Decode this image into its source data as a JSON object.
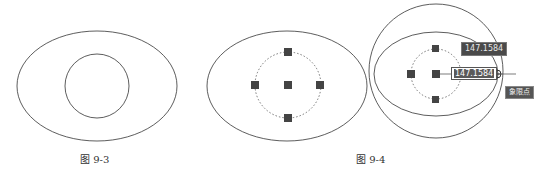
{
  "figures": [
    {
      "id": "fig-9-3",
      "caption": "图 9-3",
      "shapes": {
        "ellipse": {
          "cx": 97,
          "cy": 86,
          "rx": 80,
          "ry": 55
        },
        "inner_circle": {
          "cx": 97,
          "cy": 86,
          "r": 32
        }
      }
    },
    {
      "id": "fig-9-4",
      "caption": "图 9-4",
      "panel_a": {
        "ellipse": {
          "cx": 287,
          "cy": 86,
          "rx": 80,
          "ry": 55
        },
        "dashed_circle": {
          "cx": 288,
          "cy": 85,
          "r": 33
        },
        "grips": [
          "center",
          "top",
          "bottom",
          "left",
          "right"
        ]
      },
      "panel_b": {
        "outer_circle": {
          "cx": 436,
          "cy": 71,
          "r": 67
        },
        "ellipse": {
          "cx": 436,
          "cy": 74,
          "rx": 62,
          "ry": 42
        },
        "dashed_circle": {
          "cx": 436,
          "cy": 74,
          "r": 25
        },
        "grips": [
          "center",
          "top",
          "bottom",
          "left"
        ],
        "snap_marker": {
          "x": 497,
          "y": 74
        }
      }
    }
  ],
  "tooltips": {
    "dimension_display": "147.1584",
    "dimension_input": "147.1584",
    "snap_label": "象限点"
  },
  "colors": {
    "stroke": "#333333",
    "grip": "#444444",
    "tooltip_bg": "#4a4a4a"
  }
}
